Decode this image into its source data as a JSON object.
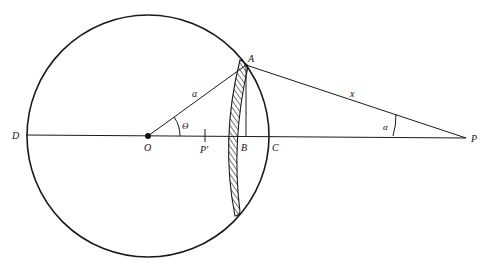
{
  "diagram": {
    "colors": {
      "stroke": "#1a1a1a",
      "background": "#ffffff"
    },
    "labels": {
      "A": "A",
      "B": "B",
      "C": "C",
      "D": "D",
      "O": "O",
      "P": "P",
      "P_prime": "P′",
      "a": "a",
      "x": "x",
      "theta": "Θ",
      "alpha": "α"
    },
    "points": {
      "O": [
        148,
        136
      ],
      "A": [
        246,
        65
      ],
      "B": [
        246,
        137
      ],
      "C": [
        270,
        137
      ],
      "D": [
        26,
        135
      ],
      "P": [
        466,
        138
      ],
      "P_prime": [
        205,
        136
      ]
    },
    "circle": {
      "cx": 148,
      "cy": 136,
      "r": 121
    },
    "segments": [
      {
        "name": "radius-a",
        "from": "O",
        "to": "A",
        "label": "a"
      },
      {
        "name": "line-x",
        "from": "A",
        "to": "P",
        "label": "x"
      },
      {
        "name": "axis",
        "from": "D",
        "to": "P"
      },
      {
        "name": "perpendicular-AB",
        "from": "A",
        "to": "B"
      }
    ],
    "angles": [
      {
        "name": "theta",
        "vertex": "O",
        "label": "Θ"
      },
      {
        "name": "alpha",
        "vertex": "P",
        "label": "α"
      }
    ],
    "hatched_region": "thin crescent-shaped shell near chord through A"
  }
}
